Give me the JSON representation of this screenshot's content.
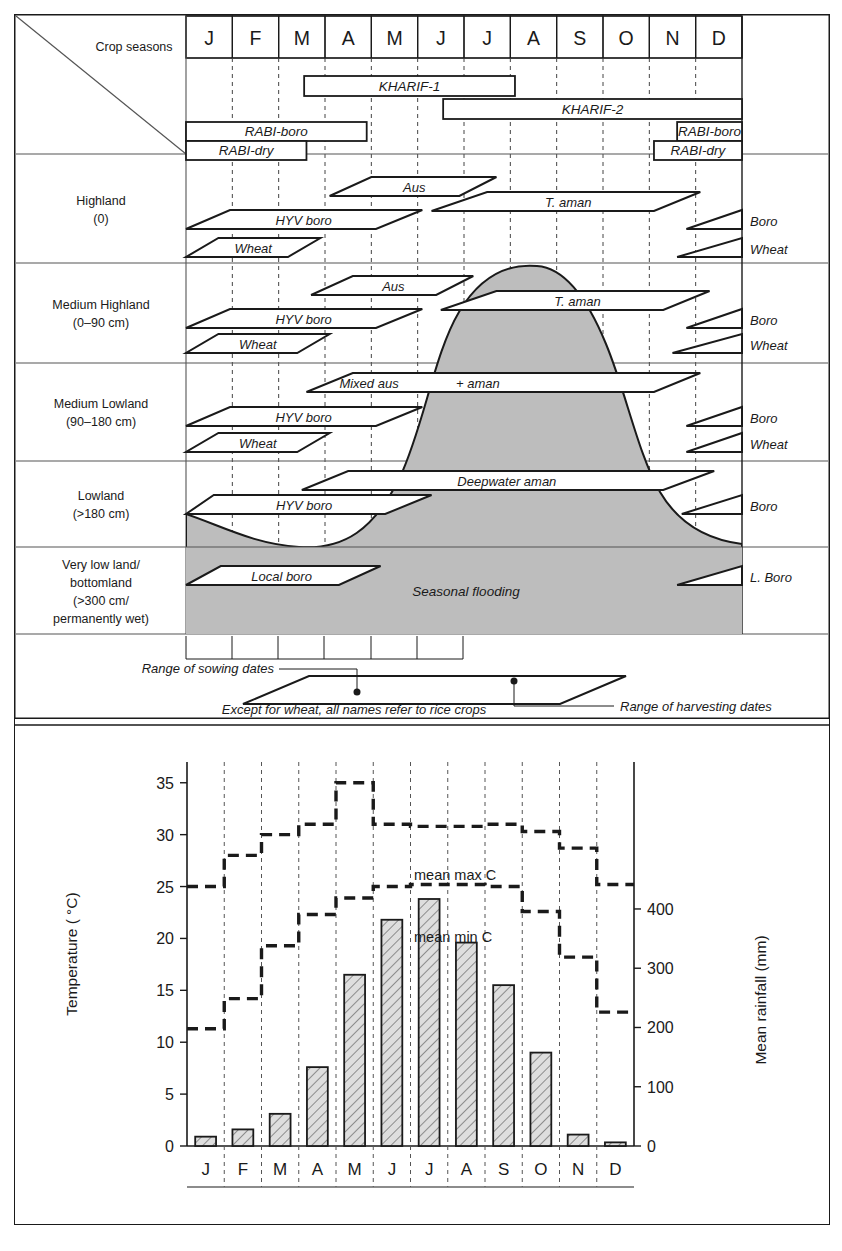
{
  "figure": {
    "title_cell": "Crop seasons",
    "months": [
      "J",
      "F",
      "M",
      "A",
      "M",
      "J",
      "J",
      "A",
      "S",
      "O",
      "N",
      "D"
    ]
  },
  "seasons": [
    {
      "name": "KHARIF-1",
      "start_month": 2.55,
      "end_month": 7.1
    },
    {
      "name": "KHARIF-2",
      "start_month": 5.55,
      "end_month": 12.0
    },
    {
      "name": "RABI-boro",
      "start_month": 0.0,
      "end_month": 3.9
    },
    {
      "name": "RABI-dry",
      "start_month": 0.0,
      "end_month": 2.6
    },
    {
      "name": "RABI-boro",
      "start_month": 10.6,
      "end_month": 12.0
    },
    {
      "name": "RABI-dry",
      "start_month": 10.1,
      "end_month": 12.0
    }
  ],
  "land_types": [
    {
      "label_line1": "Highland",
      "label_line2": "(0)",
      "label_line3": "",
      "label_line4": ""
    },
    {
      "label_line1": "Medium Highland",
      "label_line2": "(0–90 cm)",
      "label_line3": "",
      "label_line4": ""
    },
    {
      "label_line1": "Medium Lowland",
      "label_line2": "(90–180 cm)",
      "label_line3": "",
      "label_line4": ""
    },
    {
      "label_line1": "Lowland",
      "label_line2": "(>180 cm)",
      "label_line3": "",
      "label_line4": ""
    },
    {
      "label_line1": "Very low land/",
      "label_line2": "bottomland",
      "label_line3": "(>300 cm/",
      "label_line4": "permanently wet)"
    }
  ],
  "crops": {
    "highland": [
      {
        "name": "Aus",
        "sow_start": 3.1,
        "sow_end": 4.0,
        "harv_start": 5.9,
        "harv_end": 6.7
      },
      {
        "name": "T. aman",
        "sow_start": 5.3,
        "sow_end": 6.5,
        "harv_start": 10.1,
        "harv_end": 11.1
      },
      {
        "name": "HYV boro",
        "sow_start": 0.0,
        "sow_end": 0.95,
        "harv_start": 4.1,
        "harv_end": 5.1
      },
      {
        "name": "Wheat",
        "sow_start": 0.0,
        "sow_end": 0.7,
        "harv_start": 2.2,
        "harv_end": 2.9
      },
      {
        "name": "Boro",
        "sow_start": 10.8,
        "sow_end": 12.0,
        "harv_start": 12.0,
        "harv_end": 12.0
      },
      {
        "name": "Wheat",
        "sow_start": 10.6,
        "sow_end": 12.0,
        "harv_start": 12.0,
        "harv_end": 12.0
      }
    ],
    "medium_highland": [
      {
        "name": "Aus",
        "sow_start": 2.7,
        "sow_end": 3.6,
        "harv_start": 5.4,
        "harv_end": 6.2
      },
      {
        "name": "T. aman",
        "sow_start": 5.5,
        "sow_end": 6.7,
        "harv_start": 10.3,
        "harv_end": 11.3
      },
      {
        "name": "HYV boro",
        "sow_start": 0.0,
        "sow_end": 0.95,
        "harv_start": 4.1,
        "harv_end": 5.1
      },
      {
        "name": "Wheat",
        "sow_start": 0.0,
        "sow_end": 0.7,
        "harv_start": 2.4,
        "harv_end": 3.1
      },
      {
        "name": "Boro",
        "sow_start": 10.8,
        "sow_end": 12.0,
        "harv_start": 12.0,
        "harv_end": 12.0
      },
      {
        "name": "Wheat",
        "sow_start": 10.5,
        "sow_end": 12.0,
        "harv_start": 12.0,
        "harv_end": 12.0
      }
    ],
    "medium_lowland": [
      {
        "name": "Mixed aus",
        "sow_start": 2.6,
        "sow_end": 3.6,
        "harv_start": 0,
        "harv_end": 0
      },
      {
        "name": "+ aman",
        "sow_start": 0,
        "sow_end": 0,
        "harv_start": 10.1,
        "harv_end": 11.1
      },
      {
        "name": "HYV boro",
        "sow_start": 0.0,
        "sow_end": 0.95,
        "harv_start": 4.1,
        "harv_end": 5.1
      },
      {
        "name": "Wheat",
        "sow_start": 0.0,
        "sow_end": 0.7,
        "harv_start": 2.4,
        "harv_end": 3.1
      },
      {
        "name": "Boro",
        "sow_start": 10.8,
        "sow_end": 12.0,
        "harv_start": 12.0,
        "harv_end": 12.0
      },
      {
        "name": "Wheat",
        "sow_start": 10.8,
        "sow_end": 12.0,
        "harv_start": 12.0,
        "harv_end": 12.0
      }
    ],
    "lowland": [
      {
        "name": "Deepwater aman",
        "sow_start": 2.5,
        "sow_end": 3.5,
        "harv_start": 10.3,
        "harv_end": 11.4
      },
      {
        "name": "HYV boro",
        "sow_start": 0.0,
        "sow_end": 0.6,
        "harv_start": 4.3,
        "harv_end": 5.3
      },
      {
        "name": "Boro",
        "sow_start": 10.7,
        "sow_end": 12.0,
        "harv_start": 12.0,
        "harv_end": 12.0
      }
    ],
    "very_low_land": [
      {
        "name": "Local boro",
        "sow_start": 0.0,
        "sow_end": 0.75,
        "harv_start": 3.3,
        "harv_end": 4.2
      },
      {
        "name": "L. Boro",
        "sow_start": 10.6,
        "sow_end": 12.0,
        "harv_start": 12.0,
        "harv_end": 12.0
      }
    ]
  },
  "flooding_label": "Seasonal flooding",
  "legend": {
    "sowing_label": "Range of sowing dates",
    "harvesting_label": "Range of harvesting dates",
    "note": "Except for wheat, all names refer to rice crops"
  },
  "colors": {
    "flood_fill": "#bdbdbd",
    "bar_fill": "#d9d9d9",
    "line": "#1a1a1a",
    "grid": "#7a7a7a"
  },
  "chart_data": {
    "type": "bar",
    "title": "",
    "categories": [
      "J",
      "F",
      "M",
      "A",
      "M",
      "J",
      "J",
      "A",
      "S",
      "O",
      "N",
      "D"
    ],
    "xlabel": "",
    "ylabel": "Temperature ( °C)",
    "y2label": "Mean rainfall (mm)",
    "ylim": [
      0,
      37
    ],
    "yticks": [
      0,
      5,
      10,
      15,
      20,
      25,
      30,
      35
    ],
    "y2lim": [
      0,
      648
    ],
    "y2ticks": [
      0,
      100,
      200,
      300,
      400
    ],
    "grid": "vertical-dashed",
    "legend": [
      "mean max °C",
      "mean min °C"
    ],
    "annotations": [
      {
        "text": "mean max  C",
        "x": 6.1,
        "y": 31.8
      },
      {
        "text": "mean min  C",
        "x": 6.1,
        "y": 26.1
      }
    ],
    "series": [
      {
        "name": "Mean rainfall (mm)",
        "unit": "mm",
        "type": "bar",
        "values": [
          15,
          28,
          55,
          135,
          290,
          383,
          418,
          345,
          273,
          158,
          20,
          6
        ]
      },
      {
        "name": "mean max °C",
        "unit": "degC",
        "type": "step",
        "values": [
          25.0,
          28.0,
          30.0,
          31.0,
          35.0,
          31.0,
          30.8,
          30.8,
          31.0,
          30.3,
          28.7,
          25.2
        ]
      },
      {
        "name": "mean min °C",
        "unit": "degC",
        "type": "step",
        "values": [
          11.3,
          14.2,
          19.3,
          22.3,
          23.9,
          25.0,
          25.2,
          25.2,
          25.0,
          22.6,
          18.2,
          12.9
        ]
      }
    ],
    "bar_temperature_scale_values": [
      0.9,
      1.6,
      3.1,
      7.6,
      16.5,
      21.8,
      23.8,
      19.6,
      15.5,
      9.0,
      1.1,
      0.35
    ]
  }
}
